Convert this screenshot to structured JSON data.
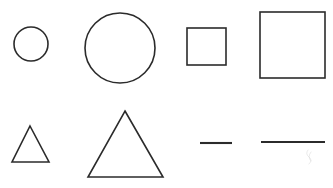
{
  "canvas": {
    "width": 333,
    "height": 188,
    "background_color": "#ffffff",
    "stroke_color": "#2b2b2b",
    "description": "Line drawing of eight outlined geometric shapes arranged in two rows"
  },
  "figure": {
    "rows": [
      {
        "row_label": "row-1",
        "shapes": [
          {
            "name": "small-circle",
            "type": "circle",
            "label": "Small circle",
            "cx": 31,
            "cy": 44,
            "r": 17
          },
          {
            "name": "large-circle",
            "type": "circle",
            "label": "Large circle",
            "cx": 120,
            "cy": 48,
            "r": 35
          },
          {
            "name": "small-square",
            "type": "square",
            "label": "Small square",
            "x": 187,
            "y": 28,
            "width": 39,
            "height": 37
          },
          {
            "name": "large-square",
            "type": "square",
            "label": "Large square",
            "x": 260,
            "y": 12,
            "width": 65,
            "height": 66
          }
        ]
      },
      {
        "row_label": "row-2",
        "shapes": [
          {
            "name": "small-triangle",
            "type": "triangle",
            "label": "Small triangle",
            "points": "30,126 49,162 12,162"
          },
          {
            "name": "large-triangle",
            "type": "triangle",
            "label": "Large triangle",
            "points": "125,111 163,177 88,177"
          },
          {
            "name": "short-line",
            "type": "line",
            "label": "Short line segment",
            "x1": 200,
            "y1": 143,
            "x2": 232,
            "y2": 143
          },
          {
            "name": "long-line",
            "type": "line",
            "label": "Long line segment",
            "x1": 261,
            "y1": 142,
            "x2": 325,
            "y2": 142
          }
        ]
      }
    ],
    "artifacts": [
      {
        "name": "faint-smudge",
        "label": "Faint scan smudge below long line",
        "x": 305,
        "y": 148,
        "width": 8,
        "height": 20
      }
    ]
  },
  "accessibility": {
    "title": "Geometric shapes: circles, squares, triangles and lines in small and large sizes"
  }
}
